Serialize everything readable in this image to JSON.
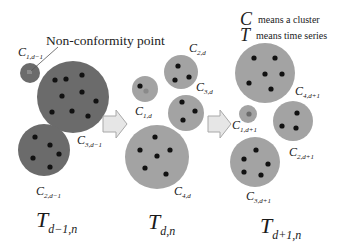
{
  "annotation": {
    "non_conformity_label": "Non-conformity point"
  },
  "legend": {
    "c_symbol": "C",
    "c_text": "means a cluster",
    "t_symbol": "T",
    "t_text": "means time series"
  },
  "colors": {
    "dark_cluster": "#6b6b6b",
    "light_cluster": "#a3a3a3",
    "point": "#111111",
    "nonconformity_point": "#888888",
    "arrow_fill": "#e6e6e6",
    "arrow_stroke": "#a8a8a8"
  },
  "panels": [
    {
      "time_label": {
        "base": "T",
        "sub": "d−1,n"
      },
      "clusters": [
        {
          "base": "C",
          "sub": "1,d−1"
        },
        {
          "base": "C",
          "sub": "3,d−1"
        },
        {
          "base": "C",
          "sub": "2,d−1"
        }
      ]
    },
    {
      "time_label": {
        "base": "T",
        "sub": "d,n"
      },
      "clusters": [
        {
          "base": "C",
          "sub": "1,d"
        },
        {
          "base": "C",
          "sub": "2,d"
        },
        {
          "base": "C",
          "sub": "3,d"
        },
        {
          "base": "C",
          "sub": "4,d"
        }
      ]
    },
    {
      "time_label": {
        "base": "T",
        "sub": "d+1,n"
      },
      "clusters": [
        {
          "base": "C",
          "sub": "4,d+1"
        },
        {
          "base": "C",
          "sub": "1,d+1"
        },
        {
          "base": "C",
          "sub": "2,d+1"
        },
        {
          "base": "C",
          "sub": "3,d+1"
        }
      ]
    }
  ]
}
